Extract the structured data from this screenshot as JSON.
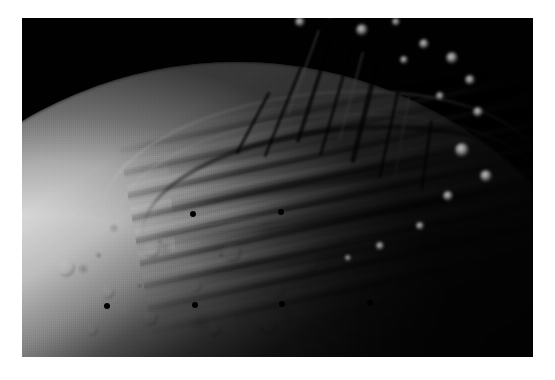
{
  "page": {
    "kind": "photograph",
    "background_color": "#ffffff",
    "width_px": 555,
    "height_px": 380
  },
  "photo": {
    "name": "planetary-surface-photograph",
    "subject": "icy moon limb with grooved and ridged terrain",
    "frame": {
      "x": 22,
      "y": 18,
      "width": 511,
      "height": 339
    },
    "colors": {
      "space_black": "#010101",
      "terminator_black": "#060606",
      "plains_mid_gray": "#9a9a9a",
      "plains_light_gray": "#c4c4c4",
      "ridge_highlight": "#e8e8e8",
      "groove_shadow": "#1d1d1d",
      "border_white": "#ffffff"
    }
  },
  "regions": [
    {
      "id": "space",
      "label": "black space background",
      "corner": "upper-left"
    },
    {
      "id": "limb",
      "label": "illuminated limb arc",
      "path": "lower-left to upper-right"
    },
    {
      "id": "grooved-terrain",
      "label": "parallel ridge and groove bands",
      "corner": "center"
    },
    {
      "id": "terminator",
      "label": "shadowed terminator zone",
      "corner": "upper-right"
    },
    {
      "id": "cratered-plains",
      "label": "mottled cratered plains",
      "corner": "lower-left"
    },
    {
      "id": "scarps",
      "label": "linear scarps and fault troughs",
      "corner": "right"
    }
  ],
  "reseau_marks": [
    {
      "x": 193,
      "y": 214
    },
    {
      "x": 281,
      "y": 212
    },
    {
      "x": 107,
      "y": 306
    },
    {
      "x": 195,
      "y": 305
    },
    {
      "x": 282,
      "y": 304
    },
    {
      "x": 370,
      "y": 303
    }
  ],
  "scarps": [
    {
      "x": 330,
      "y": 36,
      "w": 4,
      "h": 112,
      "rot": 18,
      "tone": "dark"
    },
    {
      "x": 352,
      "y": 40,
      "w": 3,
      "h": 120,
      "rot": 16,
      "tone": "dark"
    },
    {
      "x": 300,
      "y": 66,
      "w": 3,
      "h": 98,
      "rot": 22,
      "tone": "dark"
    },
    {
      "x": 376,
      "y": 58,
      "w": 5,
      "h": 108,
      "rot": 14,
      "tone": "dark"
    },
    {
      "x": 398,
      "y": 84,
      "w": 3,
      "h": 96,
      "rot": 12,
      "tone": "dark"
    },
    {
      "x": 318,
      "y": 30,
      "w": 2,
      "h": 90,
      "rot": 20,
      "tone": "bright"
    },
    {
      "x": 362,
      "y": 52,
      "w": 2,
      "h": 92,
      "rot": 15,
      "tone": "bright"
    },
    {
      "x": 408,
      "y": 96,
      "w": 2,
      "h": 84,
      "rot": 10,
      "tone": "bright"
    },
    {
      "x": 268,
      "y": 92,
      "w": 3,
      "h": 70,
      "rot": 28,
      "tone": "dark"
    },
    {
      "x": 430,
      "y": 120,
      "w": 3,
      "h": 70,
      "rot": 8,
      "tone": "dark"
    }
  ],
  "knobs": [
    {
      "x": 300,
      "y": 22,
      "r": 5,
      "tone": "bright"
    },
    {
      "x": 330,
      "y": 14,
      "r": 4,
      "tone": "bright"
    },
    {
      "x": 362,
      "y": 30,
      "r": 6,
      "tone": "bright"
    },
    {
      "x": 396,
      "y": 22,
      "r": 4,
      "tone": "bright"
    },
    {
      "x": 424,
      "y": 44,
      "r": 5,
      "tone": "bright"
    },
    {
      "x": 452,
      "y": 58,
      "r": 6,
      "tone": "bright"
    },
    {
      "x": 470,
      "y": 80,
      "r": 5,
      "tone": "bright"
    },
    {
      "x": 440,
      "y": 96,
      "r": 4,
      "tone": "bright"
    },
    {
      "x": 404,
      "y": 60,
      "r": 4,
      "tone": "bright"
    },
    {
      "x": 478,
      "y": 112,
      "r": 5,
      "tone": "bright"
    },
    {
      "x": 462,
      "y": 150,
      "r": 7,
      "tone": "bright"
    },
    {
      "x": 486,
      "y": 176,
      "r": 6,
      "tone": "bright"
    },
    {
      "x": 448,
      "y": 196,
      "r": 5,
      "tone": "bright"
    },
    {
      "x": 420,
      "y": 226,
      "r": 4,
      "tone": "bright"
    },
    {
      "x": 380,
      "y": 246,
      "r": 4,
      "tone": "bright"
    },
    {
      "x": 348,
      "y": 258,
      "r": 3,
      "tone": "bright"
    }
  ],
  "craters": [
    {
      "x": 66,
      "y": 268,
      "r": 9,
      "tone": "soft"
    },
    {
      "x": 108,
      "y": 292,
      "r": 7,
      "tone": "soft"
    },
    {
      "x": 152,
      "y": 250,
      "r": 8,
      "tone": "soft"
    },
    {
      "x": 196,
      "y": 286,
      "r": 6,
      "tone": "soft"
    },
    {
      "x": 232,
      "y": 252,
      "r": 10,
      "tone": "soft"
    },
    {
      "x": 278,
      "y": 290,
      "r": 7,
      "tone": "soft"
    },
    {
      "x": 312,
      "y": 262,
      "r": 9,
      "tone": "soft"
    },
    {
      "x": 150,
      "y": 318,
      "r": 8,
      "tone": "soft"
    },
    {
      "x": 214,
      "y": 330,
      "r": 7,
      "tone": "soft"
    },
    {
      "x": 92,
      "y": 330,
      "r": 6,
      "tone": "soft"
    },
    {
      "x": 268,
      "y": 326,
      "r": 9,
      "tone": "soft"
    },
    {
      "x": 340,
      "y": 312,
      "r": 8,
      "tone": "soft"
    },
    {
      "x": 392,
      "y": 288,
      "r": 7,
      "tone": "soft"
    },
    {
      "x": 430,
      "y": 264,
      "r": 10,
      "tone": "soft"
    }
  ]
}
